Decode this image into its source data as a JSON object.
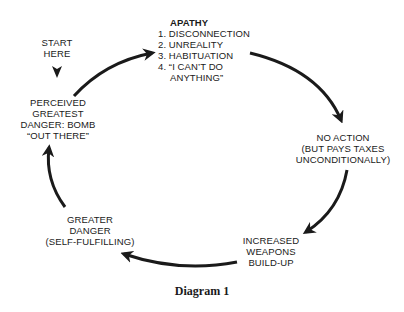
{
  "diagram": {
    "start": {
      "lines": [
        "START",
        "HERE"
      ]
    },
    "nodes": {
      "perceived": {
        "lines": [
          "PERCEIVED",
          "GREATEST",
          "DANGER: BOMB",
          "“OUT THERE”"
        ]
      },
      "apathy": {
        "title": "APATHY",
        "items": [
          "1. DISCONNECTION",
          "2. UNREALITY",
          "3. HABITUATION",
          "4. “I CAN’T DO"
        ],
        "item4_cont": "ANYTHING”"
      },
      "no_action": {
        "lines": [
          "NO ACTION",
          "(BUT PAYS TAXES",
          "UNCONDITIONALLY)"
        ]
      },
      "increased": {
        "lines": [
          "INCREASED",
          "WEAPONS",
          "BUILD-UP"
        ]
      },
      "greater": {
        "lines": [
          "GREATER",
          "DANGER",
          "(SELF-FULFILLING)"
        ]
      }
    },
    "caption": "Diagram 1",
    "colors": {
      "ink": "#1a1a1a",
      "background": "#ffffff"
    }
  }
}
